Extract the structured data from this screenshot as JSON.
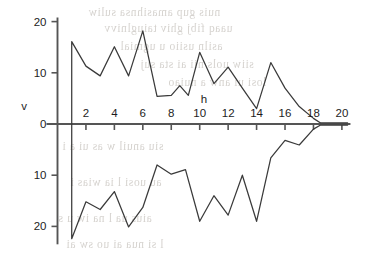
{
  "figure": {
    "background_color": "#ffffff",
    "ink_color": "#3a3a3a",
    "axis_color": "#555555"
  },
  "background_showthrough": {
    "description": "faint mirrored text bleeding through from reverse of scanned page",
    "lines": [
      "nuis gup amasihnsa suliw",
      "uaaq fibj ghiv taiuglnivv",
      "asiln usiio u   ugmial",
      "siiw uols nii ai sta suj",
      "losi ui anw   a nuiao",
      "siu anuil w as ui a i",
      "au uosi l  ia   wias  i",
      "aius  ua l  na iw  u s",
      "l si nua  ai uo  sw  ai"
    ]
  },
  "chart_data": {
    "type": "line",
    "title": "",
    "xlabel": "h",
    "ylabel": "v",
    "xlim": [
      0,
      20.6
    ],
    "ylim": [
      -23.5,
      20.8
    ],
    "grid": false,
    "legend": null,
    "xticks": [
      2,
      4,
      6,
      8,
      10,
      12,
      14,
      16,
      18,
      20
    ],
    "xtick_labels": [
      "2",
      "4",
      "6",
      "8",
      "10",
      "12",
      "14",
      "16",
      "18",
      "20"
    ],
    "yticks": [
      20,
      10,
      0,
      -10,
      -20
    ],
    "ytick_labels": [
      "20",
      "10",
      "0",
      "10",
      "20"
    ],
    "note": "Symmetric envelope of an oscillation: upper and lower traces both start at h=1 and decay to zero near h=18.5.",
    "series": [
      {
        "name": "upper envelope",
        "color": "#3a3a3a",
        "x": [
          1,
          1,
          2,
          3,
          4,
          5,
          6,
          7,
          8,
          8.6,
          9.2,
          10,
          11,
          12,
          13,
          14,
          15,
          16,
          17,
          18,
          18.5,
          20.4
        ],
        "values": [
          0,
          16.1,
          11.3,
          9.4,
          15.1,
          9.4,
          18.2,
          5.4,
          5.6,
          7.5,
          5.6,
          14.0,
          7.9,
          11.1,
          7.0,
          3.0,
          12.0,
          7.0,
          3.4,
          1.1,
          0.2,
          0.2
        ]
      },
      {
        "name": "lower envelope",
        "color": "#3a3a3a",
        "x": [
          1,
          1,
          2,
          3,
          4,
          5,
          6,
          7,
          8,
          9,
          10,
          11,
          12,
          13,
          14,
          15,
          16,
          17,
          18,
          18.5,
          20.4
        ],
        "values": [
          0,
          -22.4,
          -15.2,
          -16.7,
          -13.2,
          -20.1,
          -16.3,
          -8.0,
          -9.8,
          -8.9,
          -19.0,
          -14.0,
          -17.8,
          -10.0,
          -19.0,
          -6.6,
          -3.2,
          -4.1,
          -1.0,
          -0.2,
          -0.2
        ]
      }
    ]
  }
}
